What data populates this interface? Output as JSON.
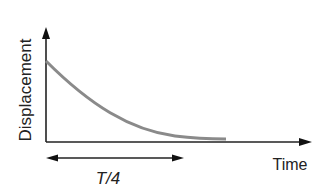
{
  "diagram": {
    "title": "",
    "y_axis_label": "Displacement",
    "x_axis_label": "Time",
    "interval_label": "T/4",
    "curve": {
      "description": "exponential decay of displacement from initial value toward zero",
      "color": "#8a8a8a"
    },
    "axis_color": "#222222"
  }
}
